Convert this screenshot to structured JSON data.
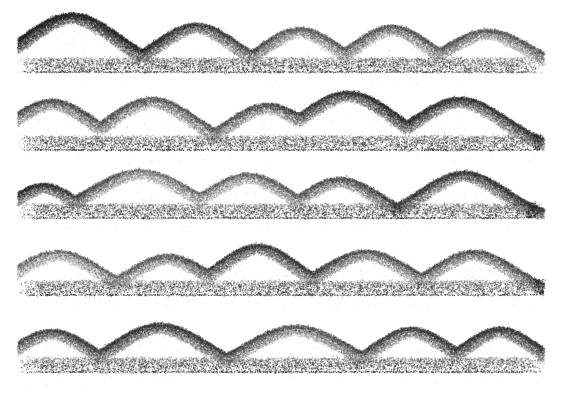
{
  "artwork": {
    "title": "Stipple Ridgeline Waves",
    "medium": "pointillist stipple",
    "caption": "",
    "background_color": "#ffffff",
    "ink_color": "#1a1a1a",
    "canvas": {
      "width": 564,
      "height": 402
    },
    "margins": {
      "left": 18,
      "right": 20,
      "top": 10,
      "bottom": 24
    }
  },
  "chart_data": {
    "type": "area",
    "xlabel": "",
    "ylabel": "",
    "grid": false,
    "legend_position": "none",
    "xlim": [
      0,
      564
    ],
    "ylim": [
      0,
      402
    ],
    "baselines": [
      72,
      150,
      218,
      295,
      372
    ],
    "baseline_band_thickness": 14,
    "row_amplitude_max": 62,
    "series": [
      {
        "name": "row-1",
        "baseline_y": 72,
        "peaks": [
          {
            "x": 72,
            "height": 58,
            "width": 108,
            "weight": 1.0
          },
          {
            "x": 196,
            "height": 48,
            "width": 92,
            "weight": 0.78
          },
          {
            "x": 300,
            "height": 44,
            "width": 86,
            "weight": 0.62
          },
          {
            "x": 392,
            "height": 46,
            "width": 88,
            "weight": 0.7
          },
          {
            "x": 488,
            "height": 42,
            "width": 96,
            "weight": 0.66
          }
        ]
      },
      {
        "name": "row-2",
        "baseline_y": 150,
        "peaks": [
          {
            "x": 52,
            "height": 50,
            "width": 96,
            "weight": 0.72
          },
          {
            "x": 152,
            "height": 52,
            "width": 100,
            "weight": 0.68
          },
          {
            "x": 268,
            "height": 46,
            "width": 92,
            "weight": 0.6
          },
          {
            "x": 348,
            "height": 58,
            "width": 108,
            "weight": 0.95
          },
          {
            "x": 460,
            "height": 52,
            "width": 104,
            "weight": 0.8
          }
        ]
      },
      {
        "name": "row-3",
        "baseline_y": 218,
        "peaks": [
          {
            "x": 44,
            "height": 34,
            "width": 70,
            "weight": 0.95
          },
          {
            "x": 140,
            "height": 48,
            "width": 110,
            "weight": 0.55
          },
          {
            "x": 248,
            "height": 44,
            "width": 94,
            "weight": 0.62
          },
          {
            "x": 340,
            "height": 40,
            "width": 86,
            "weight": 0.72
          },
          {
            "x": 464,
            "height": 46,
            "width": 94,
            "weight": 0.82
          }
        ]
      },
      {
        "name": "row-4",
        "baseline_y": 295,
        "peaks": [
          {
            "x": 58,
            "height": 44,
            "width": 96,
            "weight": 0.58
          },
          {
            "x": 168,
            "height": 40,
            "width": 88,
            "weight": 0.62
          },
          {
            "x": 258,
            "height": 50,
            "width": 92,
            "weight": 0.92
          },
          {
            "x": 366,
            "height": 44,
            "width": 98,
            "weight": 0.66
          },
          {
            "x": 474,
            "height": 44,
            "width": 92,
            "weight": 0.7
          }
        ]
      },
      {
        "name": "row-5",
        "baseline_y": 372,
        "peaks": [
          {
            "x": 52,
            "height": 42,
            "width": 88,
            "weight": 0.72
          },
          {
            "x": 160,
            "height": 48,
            "width": 104,
            "weight": 0.88
          },
          {
            "x": 296,
            "height": 46,
            "width": 110,
            "weight": 0.64
          },
          {
            "x": 412,
            "height": 44,
            "width": 86,
            "weight": 0.8
          },
          {
            "x": 500,
            "height": 44,
            "width": 84,
            "weight": 0.84
          }
        ]
      }
    ]
  }
}
